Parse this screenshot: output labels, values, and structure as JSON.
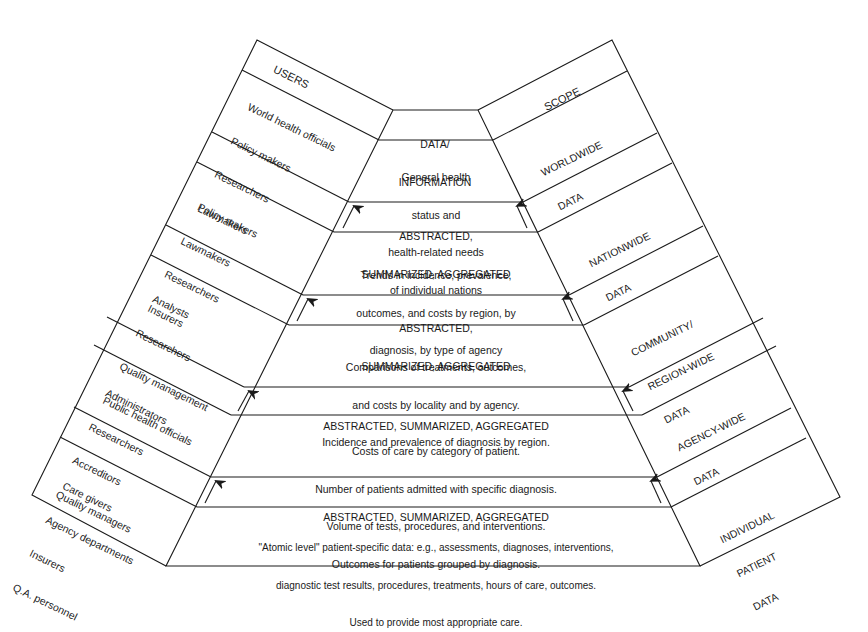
{
  "diagram": {
    "colors": {
      "stroke": "#1a1a1a",
      "background": "#ffffff"
    },
    "users_column": {
      "header": "USERS",
      "groups": [
        {
          "level": "worldwide",
          "lines": [
            "World health officials",
            "Policy makers",
            "Researchers",
            "Lawmakers"
          ]
        },
        {
          "level": "nationwide",
          "lines": [
            "Policy makers",
            "Lawmakers",
            "Researchers",
            "Insurers"
          ]
        },
        {
          "level": "community",
          "lines": [
            "Analysts",
            "Researchers",
            "Quality management",
            "Public health officials"
          ]
        },
        {
          "level": "agency",
          "lines": [
            "Administrators",
            "Researchers",
            "Accreditors",
            "Quality managers"
          ]
        },
        {
          "level": "individual",
          "lines": [
            "Care givers",
            "Agency departments",
            "Insurers",
            "Q.A. personnel"
          ]
        }
      ]
    },
    "data_column": {
      "header": [
        "DATA/",
        "INFORMATION"
      ],
      "levels": [
        {
          "lines": [
            "General health",
            "status and",
            "health-related needs",
            "of individual nations"
          ]
        },
        {
          "lines": [
            "Trends in incidence, prevalence,",
            "outcomes, and costs by region, by",
            "diagnosis, by type of agency"
          ]
        },
        {
          "lines": [
            "Comparisons of treatments, outcomes,",
            "and costs by locality and by agency.",
            "Incidence and prevalence of diagnosis by region."
          ]
        },
        {
          "lines": [
            "Costs of care by category of patient.",
            "Number of patients admitted with specific diagnosis.",
            "Volume of tests, procedures, and interventions.",
            "Outcomes for patients grouped by diagnosis."
          ]
        },
        {
          "lines": [
            "\"Atomic level\" patient-specific data: e.g., assessments, diagnoses, interventions,",
            "diagnostic test results, procedures, treatments, hours of care, outcomes.",
            "Used to provide most appropriate care."
          ]
        }
      ],
      "transitions": [
        {
          "lines": [
            "ABSTRACTED,",
            "SUMMARIZED, AGGREGATED"
          ],
          "arrows": [
            "up-arrow-left",
            "up-arrow-right"
          ]
        },
        {
          "lines": [
            "ABSTRACTED,",
            "SUMMARIZED, AGGREGATED"
          ],
          "arrows": [
            "up-arrow-left",
            "up-arrow-right"
          ]
        },
        {
          "lines": [
            "ABSTRACTED, SUMMARIZED, AGGREGATED"
          ],
          "arrows": [
            "up-arrow-left",
            "up-arrow-right"
          ]
        },
        {
          "lines": [
            "ABSTRACTED, SUMMARIZED, AGGREGATED"
          ],
          "arrows": [
            "up-arrow-left",
            "up-arrow-right"
          ]
        }
      ]
    },
    "scope_column": {
      "header": "SCOPE",
      "levels": [
        {
          "lines": [
            "WORLDWIDE",
            "DATA"
          ]
        },
        {
          "lines": [
            "NATIONWIDE",
            "DATA"
          ]
        },
        {
          "lines": [
            "COMMUNITY/",
            "REGION-WIDE",
            "DATA"
          ]
        },
        {
          "lines": [
            "AGENCY-WIDE",
            "DATA"
          ]
        },
        {
          "lines": [
            "INDIVIDUAL",
            "PATIENT",
            "DATA"
          ]
        }
      ]
    }
  }
}
